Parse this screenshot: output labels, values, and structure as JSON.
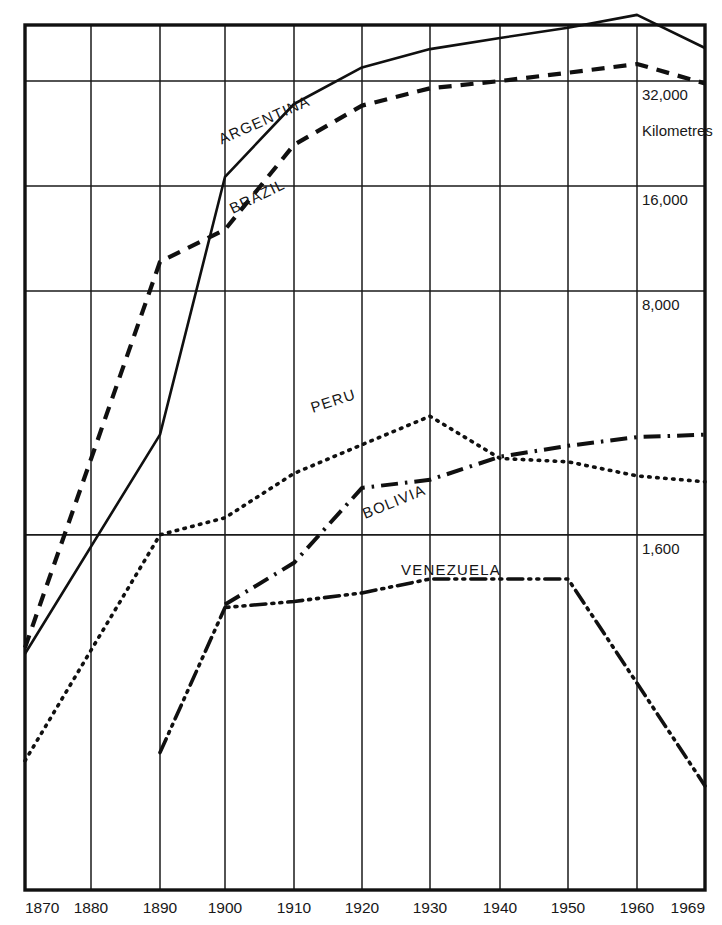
{
  "chart_data": {
    "type": "line",
    "title": "",
    "subtitle": "",
    "xlabel": "",
    "ylabel": "Kilometres",
    "scale": "log",
    "grid": true,
    "legend": "inline-labels",
    "x": [
      1870,
      1880,
      1890,
      1900,
      1910,
      1920,
      1930,
      1940,
      1950,
      1960,
      1969
    ],
    "xtick_labels": [
      "1870",
      "1880",
      "1890",
      "1900",
      "1910",
      "1920",
      "1930",
      "1940",
      "1950",
      "1960",
      "1969"
    ],
    "ytick_labels": [
      "32,000",
      "16,000",
      "8,000",
      "1,600"
    ],
    "ytick_values": [
      32000,
      16000,
      8000,
      1600
    ],
    "ylim": [
      300,
      52000
    ],
    "series": [
      {
        "name": "ARGENTINA",
        "style": "solid",
        "label_x": 1906,
        "label_y": 24000,
        "label_rotate": -24,
        "points": [
          {
            "x": 1870,
            "y": 730
          },
          {
            "x": 1890,
            "y": 3100
          },
          {
            "x": 1900,
            "y": 17000
          },
          {
            "x": 1910,
            "y": 27500
          },
          {
            "x": 1920,
            "y": 35000
          },
          {
            "x": 1930,
            "y": 39500
          },
          {
            "x": 1940,
            "y": 42500
          },
          {
            "x": 1950,
            "y": 45500
          },
          {
            "x": 1960,
            "y": 49500
          },
          {
            "x": 1969,
            "y": 39800
          }
        ]
      },
      {
        "name": "BRAZIL",
        "style": "dashed",
        "label_x": 1905,
        "label_y": 14500,
        "label_rotate": -26,
        "points": [
          {
            "x": 1870,
            "y": 760
          },
          {
            "x": 1890,
            "y": 9700
          },
          {
            "x": 1900,
            "y": 12000
          },
          {
            "x": 1910,
            "y": 21000
          },
          {
            "x": 1920,
            "y": 27200
          },
          {
            "x": 1930,
            "y": 30500
          },
          {
            "x": 1940,
            "y": 32000
          },
          {
            "x": 1950,
            "y": 33800
          },
          {
            "x": 1960,
            "y": 35800
          },
          {
            "x": 1969,
            "y": 31500
          }
        ]
      },
      {
        "name": "PERU",
        "style": "dotted",
        "label_x": 1916,
        "label_y": 3750,
        "label_rotate": -18,
        "points": [
          {
            "x": 1870,
            "y": 360
          },
          {
            "x": 1890,
            "y": 1600
          },
          {
            "x": 1900,
            "y": 1790
          },
          {
            "x": 1910,
            "y": 2400
          },
          {
            "x": 1920,
            "y": 2900
          },
          {
            "x": 1930,
            "y": 3500
          },
          {
            "x": 1940,
            "y": 2650
          },
          {
            "x": 1950,
            "y": 2590
          },
          {
            "x": 1960,
            "y": 2360
          },
          {
            "x": 1969,
            "y": 2270
          }
        ]
      },
      {
        "name": "BOLIVIA",
        "style": "dashdot",
        "label_x": 1925,
        "label_y": 1930,
        "label_rotate": -22,
        "points": [
          {
            "x": 1900,
            "y": 1010
          },
          {
            "x": 1910,
            "y": 1330
          },
          {
            "x": 1920,
            "y": 2180
          },
          {
            "x": 1930,
            "y": 2300
          },
          {
            "x": 1940,
            "y": 2680
          },
          {
            "x": 1950,
            "y": 2880
          },
          {
            "x": 1960,
            "y": 3050
          },
          {
            "x": 1969,
            "y": 3100
          }
        ]
      },
      {
        "name": "VENEZUELA",
        "style": "dashdotdot",
        "label_x": 1933,
        "label_y": 1230,
        "label_rotate": 0,
        "points": [
          {
            "x": 1890,
            "y": 380
          },
          {
            "x": 1900,
            "y": 990
          },
          {
            "x": 1910,
            "y": 1030
          },
          {
            "x": 1920,
            "y": 1090
          },
          {
            "x": 1930,
            "y": 1195
          },
          {
            "x": 1940,
            "y": 1195
          },
          {
            "x": 1950,
            "y": 1195
          },
          {
            "x": 1969,
            "y": 305
          }
        ]
      }
    ],
    "units_note": "Kilometres"
  }
}
